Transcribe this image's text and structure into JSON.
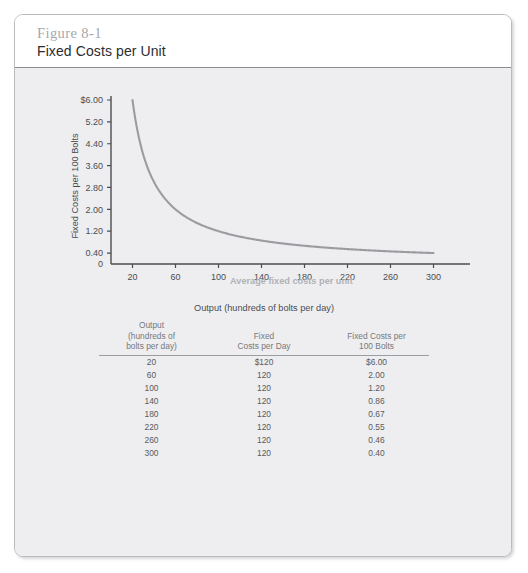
{
  "figure": {
    "number": "Figure 8-1",
    "title": "Fixed Costs per Unit"
  },
  "chart_data": {
    "type": "line",
    "title": "",
    "xlabel": "Output (hundreds of bolts per day)",
    "ylabel": "Fixed Costs per 100 Bolts",
    "xlim": [
      0,
      320
    ],
    "ylim": [
      0,
      6.0
    ],
    "xticks": [
      "20",
      "60",
      "100",
      "140",
      "180",
      "220",
      "260",
      "300"
    ],
    "xtick_values": [
      20,
      60,
      100,
      140,
      180,
      220,
      260,
      300
    ],
    "yticks": [
      "0",
      "0.40",
      "1.20",
      "2.00",
      "2.80",
      "3.60",
      "4.40",
      "5.20",
      "$6.00"
    ],
    "ytick_values": [
      0,
      0.4,
      1.2,
      2.0,
      2.8,
      3.6,
      4.4,
      5.2,
      6.0
    ],
    "grid": false,
    "legend": "none",
    "annotation": "Average fixed costs per unit",
    "series": [
      {
        "name": "Average fixed costs per unit",
        "color": "#9a9ca0",
        "x": [
          20,
          60,
          100,
          140,
          180,
          220,
          260,
          300
        ],
        "values": [
          6.0,
          2.0,
          1.2,
          0.86,
          0.67,
          0.55,
          0.46,
          0.4
        ]
      }
    ]
  },
  "table": {
    "headers": {
      "output": [
        "Output",
        "(hundreds of",
        "bolts per day)"
      ],
      "fixed": [
        "Fixed",
        "Costs per Day"
      ],
      "per100": [
        "Fixed Costs per",
        "100 Bolts"
      ]
    },
    "rows": [
      {
        "output": "20",
        "fixed": "$120",
        "per100": "$6.00"
      },
      {
        "output": "60",
        "fixed": "120",
        "per100": "2.00"
      },
      {
        "output": "100",
        "fixed": "120",
        "per100": "1.20"
      },
      {
        "output": "140",
        "fixed": "120",
        "per100": "0.86"
      },
      {
        "output": "180",
        "fixed": "120",
        "per100": "0.67"
      },
      {
        "output": "220",
        "fixed": "120",
        "per100": "0.55"
      },
      {
        "output": "260",
        "fixed": "120",
        "per100": "0.46"
      },
      {
        "output": "300",
        "fixed": "120",
        "per100": "0.40"
      }
    ]
  },
  "colors": {
    "card_border": "#b9bcbf",
    "body_background": "#eeeef0",
    "curve": "#9a9ca0",
    "axis": "#4a4c50",
    "figure_number": "#a6a8ac",
    "title_text": "#2c2c2e"
  }
}
